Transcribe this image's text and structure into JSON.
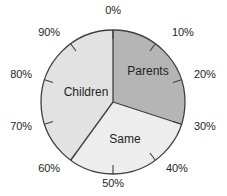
{
  "chart_data": {
    "type": "pie",
    "title": "",
    "subtitle": "",
    "xlabel": "",
    "ylabel": "",
    "grid": false,
    "legend_position": "inside-slices",
    "units": "percent",
    "start_angle_deg": 0,
    "direction": "clockwise",
    "axis_range_percent": [
      0,
      100
    ],
    "tick_interval_percent": 10,
    "categories": [
      "Parents",
      "Same",
      "Children"
    ],
    "values": [
      30,
      30,
      40
    ],
    "slices": [
      {
        "label": "Parents",
        "value": 30,
        "start_percent": 0,
        "end_percent": 30,
        "color": "#b5b5b5",
        "label_x": 148,
        "label_y": 71
      },
      {
        "label": "Same",
        "value": 30,
        "start_percent": 30,
        "end_percent": 60,
        "color": "#ededed",
        "label_x": 125,
        "label_y": 139
      },
      {
        "label": "Children",
        "value": 40,
        "start_percent": 60,
        "end_percent": 100,
        "color": "#e2e2e2",
        "label_x": 86,
        "label_y": 92
      }
    ],
    "tick_labels": [
      {
        "text": "0%",
        "percent": 0,
        "x": 113,
        "y": 11,
        "anchor": "center"
      },
      {
        "text": "10%",
        "percent": 10,
        "x": 172,
        "y": 33,
        "anchor": "left"
      },
      {
        "text": "20%",
        "percent": 20,
        "x": 194,
        "y": 75,
        "anchor": "left"
      },
      {
        "text": "30%",
        "percent": 30,
        "x": 194,
        "y": 127,
        "anchor": "left"
      },
      {
        "text": "40%",
        "percent": 40,
        "x": 166,
        "y": 169,
        "anchor": "left"
      },
      {
        "text": "50%",
        "percent": 50,
        "x": 113,
        "y": 184,
        "anchor": "center"
      },
      {
        "text": "60%",
        "percent": 60,
        "x": 60,
        "y": 169,
        "anchor": "right"
      },
      {
        "text": "70%",
        "percent": 70,
        "x": 32,
        "y": 127,
        "anchor": "right"
      },
      {
        "text": "80%",
        "percent": 80,
        "x": 32,
        "y": 75,
        "anchor": "right"
      },
      {
        "text": "90%",
        "percent": 90,
        "x": 60,
        "y": 33,
        "anchor": "right"
      }
    ],
    "geometry": {
      "center_x": 113,
      "center_y": 102,
      "radius": 72,
      "tick_inner_radius": 63,
      "outline_color": "#3f3f3f",
      "outline_width": 1.3,
      "separator_color": "#3f3f3f",
      "separator_width": 1.3,
      "tick_color": "#3f3f3f",
      "tick_width": 1.1
    },
    "background_color": "#ffffff",
    "text_color": "#231f20"
  }
}
